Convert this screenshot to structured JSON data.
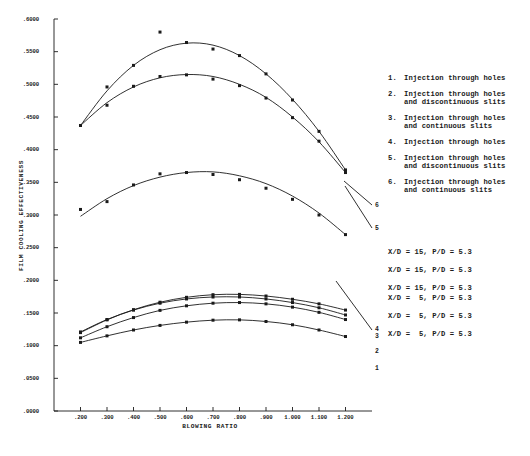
{
  "chart_data": {
    "type": "line",
    "title": "",
    "xlabel": "BLOWING RATIO",
    "ylabel": "FILM COOLING EFFECTIVENESS",
    "xlim": [
      0.1,
      1.3
    ],
    "ylim": [
      0.0,
      0.6
    ],
    "grid": false,
    "legend_position": "right",
    "xticks": [
      ".200",
      ".300",
      ".400",
      ".500",
      ".600",
      ".700",
      ".800",
      ".900",
      "1.000",
      "1.100",
      "1.200"
    ],
    "xtick_values": [
      0.2,
      0.3,
      0.4,
      0.5,
      0.6,
      0.7,
      0.8,
      0.9,
      1.0,
      1.1,
      1.2
    ],
    "yticks": [
      ".6000",
      ".5500",
      ".5000",
      ".4500",
      ".4000",
      ".3500",
      ".3000",
      ".2500",
      ".2000",
      ".1500",
      ".1000",
      ".0500",
      ".0000"
    ],
    "ytick_values": [
      0.6,
      0.55,
      0.5,
      0.45,
      0.4,
      0.35,
      0.3,
      0.25,
      0.2,
      0.15,
      0.1,
      0.05,
      0.0
    ],
    "marker": "square",
    "line_color": "#1a1a1a",
    "series": [
      {
        "name": "1",
        "end_label": "1",
        "x": [
          0.2,
          0.3,
          0.4,
          0.5,
          0.6,
          0.7,
          0.8,
          0.9,
          1.0,
          1.1,
          1.2
        ],
        "y": [
          0.105,
          0.115,
          0.124,
          0.131,
          0.136,
          0.139,
          0.1395,
          0.137,
          0.132,
          0.124,
          0.114
        ],
        "points_x": [
          0.2,
          0.3,
          0.4,
          0.5,
          0.6,
          0.7,
          0.8,
          0.9,
          1.0,
          1.1,
          1.2
        ],
        "points_y": [
          0.105,
          0.115,
          0.124,
          0.131,
          0.136,
          0.139,
          0.1395,
          0.137,
          0.132,
          0.124,
          0.114
        ]
      },
      {
        "name": "2",
        "end_label": "2",
        "x": [
          0.2,
          0.3,
          0.4,
          0.5,
          0.6,
          0.7,
          0.8,
          0.9,
          1.0,
          1.1,
          1.2
        ],
        "y": [
          0.112,
          0.129,
          0.143,
          0.154,
          0.161,
          0.165,
          0.166,
          0.164,
          0.159,
          0.151,
          0.14
        ],
        "points_x": [
          0.2,
          0.3,
          0.4,
          0.5,
          0.6,
          0.7,
          0.8,
          0.9,
          1.0,
          1.1,
          1.2
        ],
        "points_y": [
          0.112,
          0.129,
          0.143,
          0.154,
          0.161,
          0.165,
          0.166,
          0.164,
          0.159,
          0.151,
          0.14
        ]
      },
      {
        "name": "3",
        "end_label": "3",
        "x": [
          0.2,
          0.3,
          0.4,
          0.5,
          0.6,
          0.7,
          0.8,
          0.9,
          1.0,
          1.1,
          1.2
        ],
        "y": [
          0.121,
          0.14,
          0.1545,
          0.165,
          0.1715,
          0.1745,
          0.1745,
          0.1715,
          0.166,
          0.158,
          0.147
        ],
        "points_x": [
          0.2,
          0.3,
          0.4,
          0.5,
          0.6,
          0.7,
          0.8,
          0.9,
          1.0,
          1.1,
          1.2
        ],
        "points_y": [
          0.121,
          0.14,
          0.1545,
          0.165,
          0.1715,
          0.1745,
          0.1745,
          0.1715,
          0.166,
          0.158,
          0.147
        ]
      },
      {
        "name": "4",
        "end_label": "4",
        "x": [
          0.2,
          0.3,
          0.4,
          0.5,
          0.6,
          0.7,
          0.8,
          0.9,
          1.0,
          1.1,
          1.2
        ],
        "y": [
          0.12,
          0.1395,
          0.155,
          0.1665,
          0.174,
          0.178,
          0.1785,
          0.176,
          0.171,
          0.164,
          0.1545
        ],
        "points_x": [
          0.2,
          0.3,
          0.4,
          0.5,
          0.6,
          0.7,
          0.8,
          0.9,
          1.0,
          1.1,
          1.2
        ],
        "points_y": [
          0.12,
          0.1395,
          0.155,
          0.1665,
          0.174,
          0.178,
          0.1785,
          0.176,
          0.171,
          0.164,
          0.1545
        ]
      },
      {
        "name": "5",
        "end_label": "5",
        "x": [
          0.2,
          0.3,
          0.4,
          0.5,
          0.6,
          0.7,
          0.8,
          0.9,
          1.0,
          1.1,
          1.2
        ],
        "y": [
          0.298,
          0.325,
          0.345,
          0.358,
          0.365,
          0.366,
          0.36,
          0.348,
          0.329,
          0.303,
          0.27
        ],
        "points_x": [
          0.2,
          0.3,
          0.4,
          0.5,
          0.6,
          0.7,
          0.8,
          0.9,
          1.0,
          1.1,
          1.2
        ],
        "points_y": [
          0.3085,
          0.3205,
          0.346,
          0.363,
          0.365,
          0.362,
          0.354,
          0.341,
          0.324,
          0.3,
          0.27
        ]
      },
      {
        "name": "6",
        "end_label": "6",
        "x": [
          0.2,
          0.3,
          0.4,
          0.5,
          0.6,
          0.7,
          0.8,
          0.9,
          1.0,
          1.1,
          1.2
        ],
        "y": [
          0.437,
          0.472,
          0.496,
          0.51,
          0.515,
          0.512,
          0.5,
          0.48,
          0.45,
          0.412,
          0.365
        ],
        "points_x": [
          0.2,
          0.3,
          0.4,
          0.5,
          0.6,
          0.7,
          0.8,
          0.9,
          1.0,
          1.1,
          1.2
        ],
        "points_y": [
          0.437,
          0.468,
          0.497,
          0.512,
          0.5145,
          0.508,
          0.498,
          0.479,
          0.449,
          0.413,
          0.365
        ]
      },
      {
        "name": "7",
        "end_label": "",
        "x": [
          0.2,
          0.3,
          0.4,
          0.5,
          0.6,
          0.7,
          0.8,
          0.9,
          1.0,
          1.1,
          1.2
        ],
        "y": [
          0.437,
          0.49,
          0.529,
          0.553,
          0.563,
          0.56,
          0.544,
          0.516,
          0.477,
          0.428,
          0.369
        ],
        "points_x": [
          0.3,
          0.4,
          0.5,
          0.6,
          0.7,
          0.8,
          0.9,
          1.0,
          1.1,
          1.2
        ],
        "points_y": [
          0.496,
          0.529,
          0.58,
          0.564,
          0.554,
          0.544,
          0.516,
          0.476,
          0.428,
          0.369
        ]
      }
    ]
  },
  "legend": {
    "items": [
      {
        "num": "1.",
        "text": "Injection through holes"
      },
      {
        "num": "2.",
        "text": "Injection through holes\nand discontinuous slits"
      },
      {
        "num": "3.",
        "text": "Injection through holes\nand continuous slits"
      },
      {
        "num": "4.",
        "text": "Injection through holes"
      },
      {
        "num": "5.",
        "text": "Injection through holes\nand discontinuous slits"
      },
      {
        "num": "6.",
        "text": "Injection through holes\nand continuous slits"
      }
    ]
  },
  "params": {
    "rows": [
      "X/D = 15, P/D = 5.3",
      "X/D = 15, P/D = 5.3",
      "X/D = 15, P/D = 5.3",
      "X/D =  5, P/D = 5.3",
      "X/D =  5, P/D = 5.3",
      "X/D =  5, P/D = 5.3"
    ]
  }
}
